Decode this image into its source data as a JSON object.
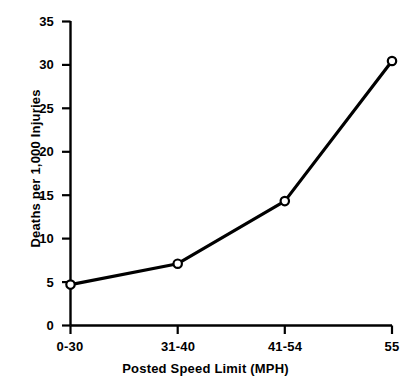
{
  "chart_data": {
    "type": "line",
    "title": "",
    "subtitle": "",
    "xlabel": "Posted Speed Limit (MPH)",
    "ylabel": "Deaths per 1,000 Injuries",
    "categories": [
      "0-30",
      "31-40",
      "41-54",
      "55"
    ],
    "values": [
      4.7,
      7.1,
      14.3,
      30.4
    ],
    "series": [
      {
        "name": "Deaths per 1,000 Injuries",
        "values": [
          4.7,
          7.1,
          14.3,
          30.4
        ]
      }
    ],
    "ylim": [
      0,
      35
    ],
    "yticks": [
      0,
      5,
      10,
      15,
      20,
      25,
      30,
      35
    ],
    "ytick_labels": [
      "0",
      "5",
      "10",
      "15",
      "20",
      "25",
      "30",
      "35"
    ],
    "xtick_labels": [
      "0-30",
      "31-40",
      "41-54",
      "55"
    ],
    "grid": false,
    "legend": "none",
    "marker": "open-circle",
    "line_color": "#000000",
    "marker_fill": "#ffffff",
    "marker_stroke": "#000000",
    "background": "#ffffff"
  },
  "axes": {
    "y_title": "Deaths per 1,000 Injuries",
    "x_title": "Posted Speed Limit (MPH)",
    "y_labels": [
      "35",
      "30",
      "25",
      "20",
      "15",
      "10",
      "5",
      "0"
    ],
    "x_labels": [
      "0-30",
      "31-40",
      "41-54",
      "55"
    ]
  }
}
